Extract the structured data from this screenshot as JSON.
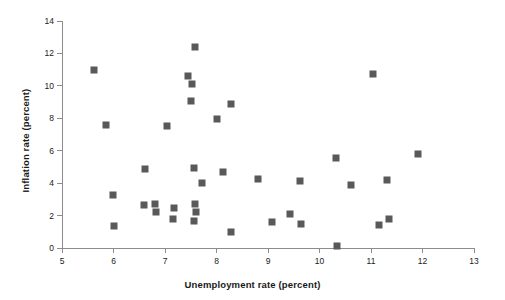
{
  "chart_data": {
    "type": "scatter",
    "title": "",
    "xlabel": "Unemployment rate (percent)",
    "ylabel": "Inflation rate (percent)",
    "xlim": [
      5,
      13
    ],
    "ylim": [
      0,
      14
    ],
    "xticks": [
      5,
      6,
      7,
      8,
      9,
      10,
      11,
      12,
      13
    ],
    "yticks": [
      0,
      2,
      4,
      6,
      8,
      10,
      12,
      14
    ],
    "xtick_labels": [
      "5",
      "6",
      "7",
      "8",
      "9",
      "10",
      "11",
      "12",
      "13"
    ],
    "ytick_labels": [
      "0",
      "2",
      "4",
      "6",
      "8",
      "10",
      "12",
      "14"
    ],
    "grid": false,
    "legend": null,
    "marker_color": "#595959",
    "marker_shape": "square",
    "axis_color": "#8c8c8c",
    "background_color": "#ffffff",
    "points": [
      {
        "x": 5.62,
        "y": 10.95
      },
      {
        "x": 5.86,
        "y": 7.57
      },
      {
        "x": 5.99,
        "y": 3.26
      },
      {
        "x": 6.0,
        "y": 1.37
      },
      {
        "x": 6.61,
        "y": 4.85
      },
      {
        "x": 6.6,
        "y": 2.65
      },
      {
        "x": 6.81,
        "y": 2.7
      },
      {
        "x": 6.83,
        "y": 2.2
      },
      {
        "x": 7.04,
        "y": 7.5
      },
      {
        "x": 7.18,
        "y": 2.47
      },
      {
        "x": 7.16,
        "y": 1.81
      },
      {
        "x": 7.44,
        "y": 10.6
      },
      {
        "x": 7.52,
        "y": 10.1
      },
      {
        "x": 7.51,
        "y": 9.09
      },
      {
        "x": 7.59,
        "y": 12.38
      },
      {
        "x": 7.56,
        "y": 4.94
      },
      {
        "x": 7.59,
        "y": 2.73
      },
      {
        "x": 7.61,
        "y": 2.2
      },
      {
        "x": 7.57,
        "y": 1.65
      },
      {
        "x": 7.72,
        "y": 4.0
      },
      {
        "x": 8.0,
        "y": 7.97
      },
      {
        "x": 8.13,
        "y": 4.7
      },
      {
        "x": 8.29,
        "y": 8.89
      },
      {
        "x": 8.29,
        "y": 1.0
      },
      {
        "x": 8.8,
        "y": 4.28
      },
      {
        "x": 9.08,
        "y": 1.58
      },
      {
        "x": 9.42,
        "y": 2.11
      },
      {
        "x": 9.62,
        "y": 4.12
      },
      {
        "x": 9.65,
        "y": 1.51
      },
      {
        "x": 10.32,
        "y": 5.55
      },
      {
        "x": 10.34,
        "y": 0.15
      },
      {
        "x": 10.62,
        "y": 3.9
      },
      {
        "x": 11.04,
        "y": 10.72
      },
      {
        "x": 11.15,
        "y": 1.42
      },
      {
        "x": 11.32,
        "y": 4.22
      },
      {
        "x": 11.35,
        "y": 1.79
      },
      {
        "x": 11.92,
        "y": 5.78
      }
    ]
  }
}
